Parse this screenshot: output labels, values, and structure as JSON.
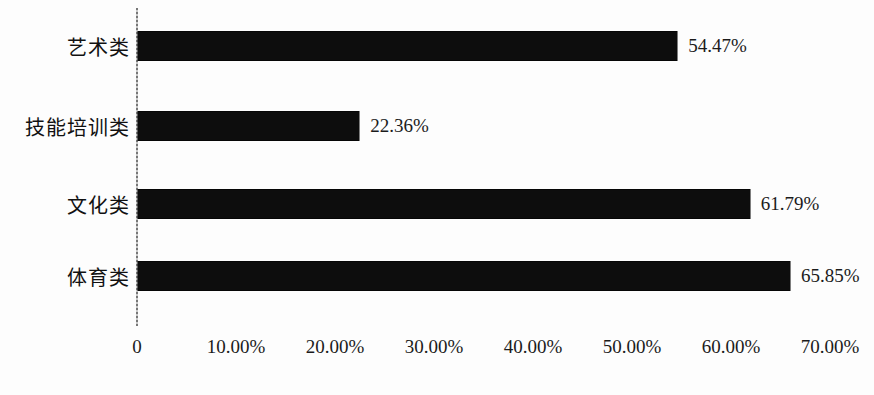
{
  "chart_data": {
    "type": "bar",
    "orientation": "horizontal",
    "title": "",
    "subtitle": "",
    "xlabel": "",
    "ylabel": "",
    "categories": [
      "艺术类",
      "技能培训类",
      "文化类",
      "体育类"
    ],
    "values": [
      54.47,
      22.36,
      61.79,
      65.85
    ],
    "value_labels": [
      "54.47%",
      "22.36%",
      "61.79%",
      "65.85%"
    ],
    "xlim": [
      0,
      70
    ],
    "xticks": [
      0,
      10,
      20,
      30,
      40,
      50,
      60,
      70
    ],
    "xtick_labels": [
      "0",
      "10.00%",
      "20.00%",
      "30.00%",
      "40.00%",
      "50.00%",
      "60.00%",
      "70.00%"
    ],
    "grid": false,
    "legend": false,
    "legend_position": "none",
    "series": [
      {
        "name": "",
        "values": [
          54.47,
          22.36,
          61.79,
          65.85
        ]
      }
    ],
    "colors": {
      "bar": "#0d0d0d",
      "axis": "#6f6f6f",
      "text": "#1b1b1b",
      "background": "#fdfdfd"
    }
  }
}
